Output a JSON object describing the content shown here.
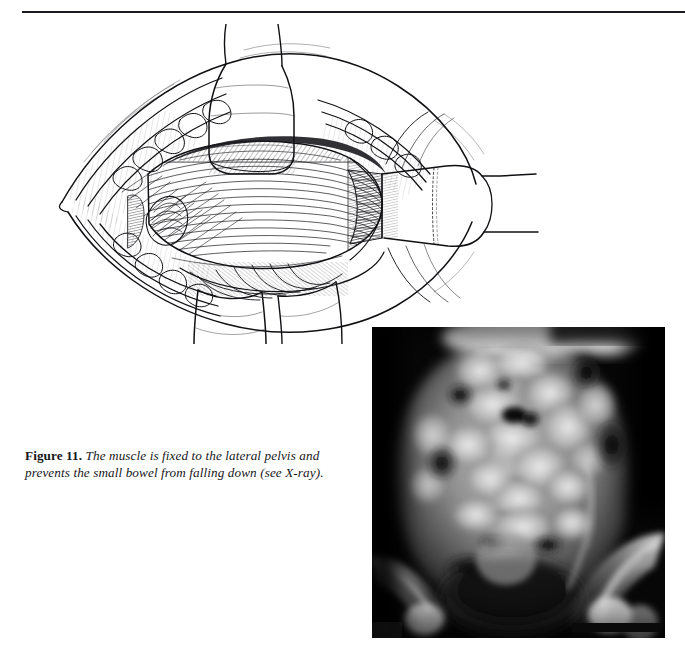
{
  "page": {
    "width": 685,
    "height": 665,
    "background_color": "#ffffff",
    "rule_color": "#1b1b1f"
  },
  "caption": {
    "figure_label": "Figure 11.",
    "text": " The muscle is fixed to the lateral pelvis and prevents the small bowel from falling down (see X-ray).",
    "full_text": "Figure 11. The muscle is fixed to the lateral pelvis and prevents the small bowel from falling down (see X-ray)."
  },
  "illustration": {
    "title": "Surgical illustration of muscle flap fixed to lateral pelvis",
    "style": "pen-and-ink line drawing",
    "line_color": "#111115",
    "fill_color": "#ffffff",
    "elements": [
      "open surgical incision with everted wound edges",
      "upper retractor blade at top center",
      "lower retractor blade at bottom center",
      "right lateral retractor blade with handle extending right",
      "central muscle flap with longitudinal fiber striations",
      "subcutaneous fat and fascial layers along incision margins",
      "hatched shading denoting deep tissue planes"
    ]
  },
  "xray": {
    "title": "Plain abdominal radiograph (X-ray)",
    "modality": "radiograph",
    "orientation": "anteroposterior pelvis and abdomen",
    "background_color": "#050505",
    "features": [
      "gas-filled small bowel loops in mid-abdomen",
      "lumbar vertebral bodies in midline",
      "bilateral iliac wings and sacroiliac joints",
      "bladder shadow in the lower pelvis",
      "radiopaque scale bar at lower right"
    ],
    "scalebar_color": "#0a0a0a"
  }
}
